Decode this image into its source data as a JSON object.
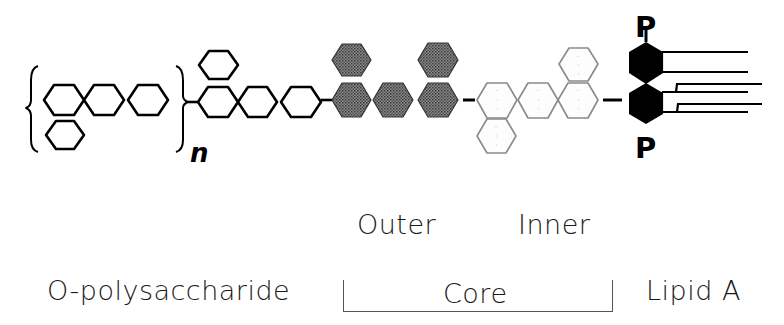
{
  "diagram": {
    "repeat_subscript": "n",
    "phosphate_top": "P",
    "phosphate_bottom": "P",
    "colors": {
      "outline": "#000000",
      "outer_core_fill": "#6e6e6e",
      "inner_core_stroke": "#8a8a8a",
      "lipid_a_fill": "#000000"
    }
  },
  "labels": {
    "outer": "Outer",
    "inner": "Inner",
    "o_polysaccharide": "O-polysaccharide",
    "core": "Core",
    "lipid_a": "Lipid A"
  },
  "regions": [
    {
      "name": "O-polysaccharide",
      "sugar_units_repeat": 4,
      "sugar_units_outside_repeat": 4,
      "style": "open outline"
    },
    {
      "name": "Outer core",
      "sugar_units": 5,
      "style": "dark stippled"
    },
    {
      "name": "Inner core",
      "sugar_units": 5,
      "style": "light dotted outline"
    },
    {
      "name": "Lipid A",
      "sugar_units": 2,
      "phosphates": 2,
      "fatty_acid_chains": 6,
      "style": "solid black"
    }
  ]
}
